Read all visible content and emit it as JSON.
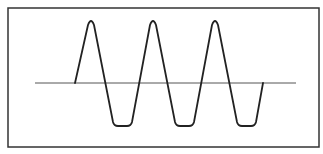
{
  "diagram": {
    "type": "waveform",
    "frame": {
      "x": 8,
      "y": 8,
      "width": 311,
      "height": 139,
      "stroke": "#333333",
      "stroke_width": 1.5
    },
    "baseline": {
      "x1": 35,
      "x2": 296,
      "y": 83,
      "stroke": "#555555",
      "stroke_width": 1
    },
    "wave": {
      "stroke": "#222222",
      "stroke_width": 1.8,
      "start": {
        "x": 75,
        "y": 83
      },
      "end": {
        "x": 263,
        "y": 83
      },
      "peaks": [
        {
          "x": 91,
          "y": 20
        },
        {
          "x": 153,
          "y": 20
        },
        {
          "x": 215,
          "y": 20
        }
      ],
      "troughs": [
        {
          "x_start": 114,
          "x_end": 131,
          "y": 126
        },
        {
          "x_start": 176,
          "x_end": 193,
          "y": 126
        },
        {
          "x_start": 238,
          "x_end": 255,
          "y": 126
        }
      ]
    },
    "colors": {
      "background": "#ffffff",
      "line": "#222222"
    }
  }
}
